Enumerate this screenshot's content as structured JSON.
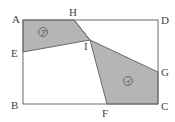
{
  "diagram": {
    "type": "geometry",
    "colors": {
      "shade": "#b5b5b5",
      "line": "#6a6a6a",
      "text": "#444444"
    },
    "rectangle": {
      "vertices": [
        "A",
        "B",
        "C",
        "D"
      ]
    },
    "points": {
      "A": "A",
      "B": "B",
      "C": "C",
      "D": "D",
      "E": "E",
      "F": "F",
      "G": "G",
      "H": "H",
      "I": "I"
    },
    "regions": [
      {
        "id": "region-a",
        "label": "ア",
        "polygon": [
          "A",
          "H",
          "I",
          "E"
        ]
      },
      {
        "id": "region-i",
        "label": "イ",
        "polygon": [
          "H",
          "I",
          "F",
          "C",
          "G"
        ]
      }
    ]
  }
}
